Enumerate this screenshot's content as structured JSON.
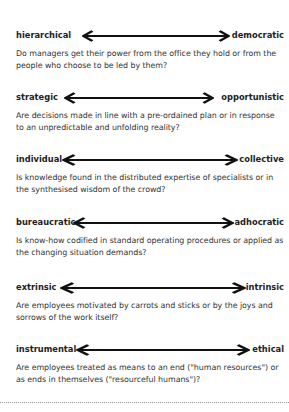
{
  "dimensions": [
    {
      "left": "hierarchical",
      "right": "democratic",
      "question": "Do managers get their power from the office they hold or from the people who choose to be led by them?"
    },
    {
      "left": "strategic",
      "right": "opportunistic",
      "question": "Are decisions made in line with a pre-ordained plan or in response to an unpredictable and unfolding reality?"
    },
    {
      "left": "individual",
      "right": "collective",
      "question": "Is knowledge found in the distributed expertise of specialists or in the synthesised wisdom of the crowd?"
    },
    {
      "left": "bureaucratic",
      "right": "adhocratic",
      "question": "Is know-how codified in standard operating procedures or applied as the changing situation demands?"
    },
    {
      "left": "extrinsic",
      "right": "intrinsic",
      "question": "Are employees motivated by carrots and sticks or by the joys and sorrows of the work itself?"
    },
    {
      "left": "instrumental",
      "right": "ethical",
      "question": "Are employees treated as means to an end (\"human resources\") or as ends in themselves (\"resourceful humans\")?"
    }
  ],
  "icons": {
    "arrow": "double-headed-arrow-icon"
  },
  "colors": {
    "text": "#2a2a2a",
    "arrow": "#111111",
    "divider": "#999999"
  }
}
